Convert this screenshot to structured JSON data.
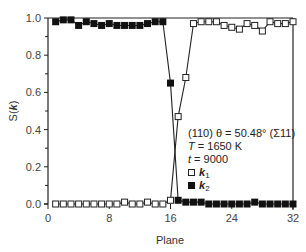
{
  "chart_data": {
    "type": "line",
    "title": "",
    "xlabel": "Plane",
    "ylabel": "S(k)",
    "xlim": [
      0,
      32
    ],
    "ylim": [
      0.0,
      1.0
    ],
    "xticks": [
      0,
      8,
      16,
      24,
      32
    ],
    "xtick_labels": [
      "0",
      "8",
      "16",
      "24",
      "32"
    ],
    "yticks": [
      0.0,
      0.2,
      0.4,
      0.6,
      0.8,
      1.0
    ],
    "ytick_labels": [
      "0.0",
      "0.2",
      "0.4",
      "0.6",
      "0.8",
      "1.0"
    ],
    "grid": false,
    "legend_position": "lower right (inside)",
    "annotation": [
      "(110) θ = 50.48° (Σ11)",
      "T = 1650 K",
      "t = 9000"
    ],
    "series": [
      {
        "name": "k1",
        "marker": "open-square",
        "x": [
          1,
          2,
          3,
          4,
          5,
          6,
          7,
          8,
          9,
          10,
          11,
          12,
          13,
          14,
          15,
          16,
          17,
          18,
          19,
          20,
          21,
          22,
          23,
          24,
          25,
          26,
          27,
          28,
          29,
          30,
          31,
          32
        ],
        "values": [
          0.0,
          0.0,
          0.0,
          0.0,
          0.0,
          0.0,
          0.0,
          0.0,
          0.0,
          0.01,
          0.0,
          0.0,
          0.01,
          0.0,
          0.0,
          0.02,
          0.47,
          0.68,
          0.97,
          0.98,
          0.98,
          0.98,
          0.96,
          0.95,
          0.94,
          0.97,
          0.96,
          0.93,
          0.98,
          0.97,
          0.97,
          0.98
        ]
      },
      {
        "name": "k2",
        "marker": "filled-square",
        "x": [
          1,
          2,
          3,
          4,
          5,
          6,
          7,
          8,
          9,
          10,
          11,
          12,
          13,
          14,
          15,
          16,
          17,
          18,
          19,
          20,
          21,
          22,
          23,
          24,
          25,
          26,
          27,
          28,
          29,
          30,
          31,
          32
        ],
        "values": [
          0.98,
          0.99,
          0.99,
          0.96,
          0.98,
          0.97,
          0.96,
          0.97,
          0.96,
          0.96,
          0.96,
          0.96,
          0.97,
          0.98,
          0.98,
          0.65,
          0.02,
          0.01,
          0.01,
          0.01,
          0.0,
          0.0,
          0.0,
          0.0,
          0.0,
          0.0,
          0.01,
          0.0,
          0.0,
          0.0,
          0.0,
          0.0
        ]
      }
    ]
  },
  "legend": {
    "line1": "(110) θ = 50.48° (Σ11)",
    "line2_var": "T",
    "line2_val": " = 1650 K",
    "line3_var": "t",
    "line3_val": " = 9000",
    "k1_label": "k",
    "k1_sub": "1",
    "k2_label": "k",
    "k2_sub": "2"
  },
  "axes": {
    "xlabel": "Plane",
    "ylabel_prefix": "S(",
    "ylabel_var": "k",
    "ylabel_suffix": ")"
  }
}
